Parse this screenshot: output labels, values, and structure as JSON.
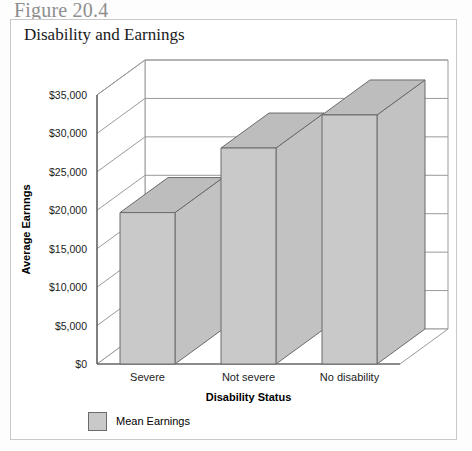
{
  "figure": {
    "caption": "Figure 20.4",
    "title": "Disability and Earnings"
  },
  "legend": {
    "series_label": "Mean Earnings",
    "swatch_color": "#c9c9c9"
  },
  "colors": {
    "bar_front": "#c9c9c9",
    "bar_side": "#c2c2c2",
    "bar_top": "#bdbdbd",
    "bar_edge": "#6b6b6b",
    "grid": "#9a9a9a",
    "axis": "#4d4d4d",
    "caption_gray": "#8e8e8e",
    "frame": "#c9c9c9"
  },
  "chart_data": {
    "type": "bar",
    "title": "Disability and Earnings",
    "xlabel": "Disability Status",
    "ylabel": "Average Earnngs",
    "categories": [
      "Severe",
      "Not severe",
      "No disability"
    ],
    "series": [
      {
        "name": "Mean Earnings",
        "values": [
          19700,
          28100,
          32400
        ]
      }
    ],
    "ylim": [
      0,
      35000
    ],
    "ytick_values": [
      0,
      5000,
      10000,
      15000,
      20000,
      25000,
      30000,
      35000
    ],
    "ytick_labels": [
      "$0",
      "$5,000",
      "$10,000",
      "$15,000",
      "$20,000",
      "$25,000",
      "$30,000",
      "$35,000"
    ],
    "grid": true,
    "legend_position": "bottom-left",
    "projection": "3d"
  }
}
